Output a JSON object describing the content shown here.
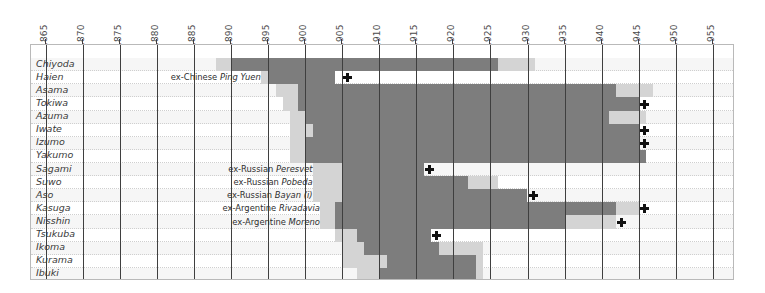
{
  "chart_data": {
    "type": "bar",
    "title": "",
    "subtitle": "",
    "xlabel": "",
    "ylabel": "",
    "orientation": "horizontal",
    "chart_kind": "gantt-timeline",
    "grid": true,
    "legend": "none",
    "xlim": [
      1863,
      1958
    ],
    "x_tick_step": 5,
    "x_ticks": [
      1865,
      1870,
      1875,
      1880,
      1885,
      1890,
      1895,
      1900,
      1905,
      1910,
      1915,
      1920,
      1925,
      1930,
      1935,
      1940,
      1945,
      1950,
      1955
    ],
    "categories": [
      "Chiyoda",
      "Haien",
      "Asama",
      "Tokiwa",
      "Azuma",
      "Iwate",
      "Izumo",
      "Yakumo",
      "Sagami",
      "Suwo",
      "Aso",
      "Kasuga",
      "Nisshin",
      "Tsukuba",
      "Ikoma",
      "Kurama",
      "Ibuki"
    ],
    "palette": {
      "dark": "#7d7d7d",
      "mid": "#a8a8a8",
      "light": "#d4d4d4",
      "pale": "#e8e8e8",
      "gridline": "#3f3f3f",
      "frame": "#b9b9b9",
      "row_alt": "#f6f6f6",
      "text": "#3a3a3a",
      "marker": "#111111"
    },
    "series": [
      {
        "name": "Chiyoda",
        "segments": [
          {
            "start": 1888,
            "end": 1890,
            "shade": "light"
          },
          {
            "start": 1890,
            "end": 1926,
            "shade": "dark"
          },
          {
            "start": 1926,
            "end": 1931,
            "shade": "light"
          }
        ],
        "markers": [],
        "annotation": ""
      },
      {
        "name": "Haien",
        "segments": [
          {
            "start": 1894,
            "end": 1895,
            "shade": "light"
          },
          {
            "start": 1895,
            "end": 1904,
            "shade": "dark"
          }
        ],
        "markers": [
          1905
        ],
        "annotation": "ex-Chinese Ping Yuen",
        "annotation_italic": "Ping Yuen"
      },
      {
        "name": "Asama",
        "segments": [
          {
            "start": 1896,
            "end": 1899,
            "shade": "light"
          },
          {
            "start": 1899,
            "end": 1942,
            "shade": "dark"
          },
          {
            "start": 1942,
            "end": 1947,
            "shade": "light"
          }
        ],
        "markers": [],
        "annotation": ""
      },
      {
        "name": "Tokiwa",
        "segments": [
          {
            "start": 1897,
            "end": 1899,
            "shade": "light"
          },
          {
            "start": 1899,
            "end": 1945,
            "shade": "dark"
          }
        ],
        "markers": [
          1945
        ],
        "annotation": ""
      },
      {
        "name": "Azuma",
        "segments": [
          {
            "start": 1898,
            "end": 1900,
            "shade": "light"
          },
          {
            "start": 1900,
            "end": 1941,
            "shade": "dark"
          },
          {
            "start": 1941,
            "end": 1946,
            "shade": "light"
          }
        ],
        "markers": [],
        "annotation": ""
      },
      {
        "name": "Iwate",
        "segments": [
          {
            "start": 1898,
            "end": 1901,
            "shade": "light"
          },
          {
            "start": 1901,
            "end": 1945,
            "shade": "dark"
          }
        ],
        "markers": [
          1945
        ],
        "annotation": ""
      },
      {
        "name": "Izumo",
        "segments": [
          {
            "start": 1898,
            "end": 1900,
            "shade": "light"
          },
          {
            "start": 1900,
            "end": 1945,
            "shade": "dark"
          }
        ],
        "markers": [
          1945
        ],
        "annotation": ""
      },
      {
        "name": "Yakumo",
        "segments": [
          {
            "start": 1898,
            "end": 1900,
            "shade": "light"
          },
          {
            "start": 1900,
            "end": 1946,
            "shade": "dark"
          }
        ],
        "markers": [],
        "annotation": ""
      },
      {
        "name": "Sagami",
        "segments": [
          {
            "start": 1901,
            "end": 1905,
            "shade": "light"
          },
          {
            "start": 1905,
            "end": 1916,
            "shade": "dark"
          }
        ],
        "markers": [
          1916
        ],
        "annotation": "ex-Russian Peresvet",
        "annotation_italic": "Peresvet"
      },
      {
        "name": "Suwo",
        "segments": [
          {
            "start": 1901,
            "end": 1905,
            "shade": "light"
          },
          {
            "start": 1905,
            "end": 1922,
            "shade": "dark"
          },
          {
            "start": 1922,
            "end": 1926,
            "shade": "light"
          }
        ],
        "markers": [],
        "annotation": "ex-Russian Pobeda",
        "annotation_italic": "Pobeda"
      },
      {
        "name": "Aso",
        "segments": [
          {
            "start": 1901,
            "end": 1905,
            "shade": "light"
          },
          {
            "start": 1905,
            "end": 1930,
            "shade": "dark"
          }
        ],
        "markers": [
          1930
        ],
        "annotation": "ex-Russian Bayan (i)",
        "annotation_italic": "Bayan (i)"
      },
      {
        "name": "Kasuga",
        "segments": [
          {
            "start": 1902,
            "end": 1904,
            "shade": "light"
          },
          {
            "start": 1904,
            "end": 1942,
            "shade": "dark"
          },
          {
            "start": 1942,
            "end": 1945,
            "shade": "light"
          }
        ],
        "markers": [
          1945
        ],
        "annotation": "ex-Argentine Rivadavia",
        "annotation_italic": "Rivadavia"
      },
      {
        "name": "Nisshin",
        "segments": [
          {
            "start": 1902,
            "end": 1904,
            "shade": "light"
          },
          {
            "start": 1904,
            "end": 1935,
            "shade": "dark"
          },
          {
            "start": 1935,
            "end": 1942,
            "shade": "light"
          }
        ],
        "markers": [
          1942
        ],
        "annotation": "ex-Argentine Moreno",
        "annotation_italic": "Moreno"
      },
      {
        "name": "Tsukuba",
        "segments": [
          {
            "start": 1904,
            "end": 1907,
            "shade": "light"
          },
          {
            "start": 1907,
            "end": 1917,
            "shade": "dark"
          }
        ],
        "markers": [
          1917
        ],
        "annotation": ""
      },
      {
        "name": "Ikoma",
        "segments": [
          {
            "start": 1905,
            "end": 1908,
            "shade": "light"
          },
          {
            "start": 1908,
            "end": 1918,
            "shade": "dark"
          },
          {
            "start": 1918,
            "end": 1924,
            "shade": "light"
          }
        ],
        "markers": [],
        "annotation": ""
      },
      {
        "name": "Kurama",
        "segments": [
          {
            "start": 1905,
            "end": 1911,
            "shade": "light"
          },
          {
            "start": 1911,
            "end": 1923,
            "shade": "dark"
          },
          {
            "start": 1923,
            "end": 1924,
            "shade": "light"
          }
        ],
        "markers": [],
        "annotation": ""
      },
      {
        "name": "Ibuki",
        "segments": [
          {
            "start": 1907,
            "end": 1910,
            "shade": "light"
          },
          {
            "start": 1910,
            "end": 1923,
            "shade": "dark"
          },
          {
            "start": 1923,
            "end": 1924,
            "shade": "light"
          }
        ],
        "markers": [],
        "annotation": ""
      }
    ]
  }
}
